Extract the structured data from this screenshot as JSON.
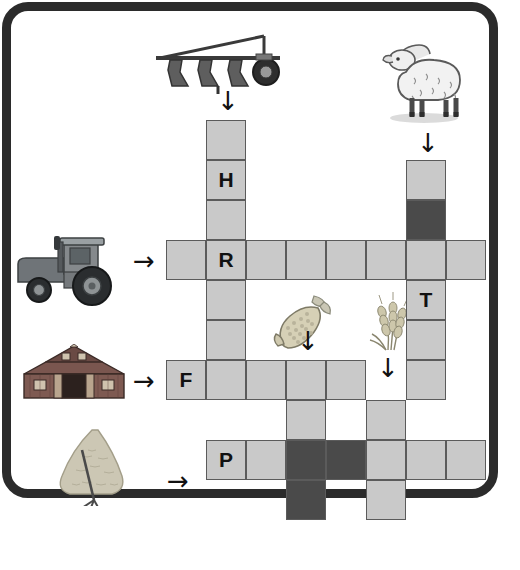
{
  "puzzle": {
    "title": "Farm crossword puzzle",
    "cell_size": 40,
    "colors": {
      "cell_light": "#c9c9c9",
      "cell_dark": "#4a4a4a",
      "cell_border": "#5b5b5b",
      "frame": "#2b2b2b",
      "page": "#ffffff"
    },
    "cells": [
      {
        "name": "cell-r0c1",
        "x": 206,
        "y": 120,
        "fill": "light",
        "letter": ""
      },
      {
        "name": "cell-r1c1",
        "x": 206,
        "y": 160,
        "fill": "light",
        "letter": "H"
      },
      {
        "name": "cell-r2c1",
        "x": 206,
        "y": 200,
        "fill": "light",
        "letter": ""
      },
      {
        "name": "cell-r0c6",
        "x": 406,
        "y": 160,
        "fill": "light",
        "letter": ""
      },
      {
        "name": "cell-r1c6",
        "x": 406,
        "y": 200,
        "fill": "dark",
        "letter": ""
      },
      {
        "name": "cell-r3c0",
        "x": 166,
        "y": 240,
        "fill": "light",
        "letter": ""
      },
      {
        "name": "cell-r3c1",
        "x": 206,
        "y": 240,
        "fill": "light",
        "letter": "R"
      },
      {
        "name": "cell-r3c2",
        "x": 246,
        "y": 240,
        "fill": "light",
        "letter": ""
      },
      {
        "name": "cell-r3c3",
        "x": 286,
        "y": 240,
        "fill": "light",
        "letter": ""
      },
      {
        "name": "cell-r3c4",
        "x": 326,
        "y": 240,
        "fill": "light",
        "letter": ""
      },
      {
        "name": "cell-r3c5",
        "x": 366,
        "y": 240,
        "fill": "light",
        "letter": ""
      },
      {
        "name": "cell-r3c6",
        "x": 406,
        "y": 240,
        "fill": "light",
        "letter": ""
      },
      {
        "name": "cell-r3c7",
        "x": 446,
        "y": 240,
        "fill": "light",
        "letter": ""
      },
      {
        "name": "cell-r4c1",
        "x": 206,
        "y": 280,
        "fill": "light",
        "letter": ""
      },
      {
        "name": "cell-r4c6",
        "x": 406,
        "y": 280,
        "fill": "light",
        "letter": "T"
      },
      {
        "name": "cell-r5c1",
        "x": 206,
        "y": 320,
        "fill": "light",
        "letter": ""
      },
      {
        "name": "cell-r5c6",
        "x": 406,
        "y": 320,
        "fill": "light",
        "letter": ""
      },
      {
        "name": "cell-r6c0",
        "x": 166,
        "y": 360,
        "fill": "light",
        "letter": "F"
      },
      {
        "name": "cell-r6c1",
        "x": 206,
        "y": 360,
        "fill": "light",
        "letter": ""
      },
      {
        "name": "cell-r6c2",
        "x": 246,
        "y": 360,
        "fill": "light",
        "letter": ""
      },
      {
        "name": "cell-r6c3",
        "x": 286,
        "y": 360,
        "fill": "light",
        "letter": ""
      },
      {
        "name": "cell-r6c4",
        "x": 326,
        "y": 360,
        "fill": "light",
        "letter": ""
      },
      {
        "name": "cell-r6c6",
        "x": 406,
        "y": 360,
        "fill": "light",
        "letter": ""
      },
      {
        "name": "cell-r7c3",
        "x": 286,
        "y": 400,
        "fill": "light",
        "letter": ""
      },
      {
        "name": "cell-r7c5",
        "x": 366,
        "y": 400,
        "fill": "light",
        "letter": ""
      },
      {
        "name": "cell-r8c1",
        "x": 206,
        "y": 440,
        "fill": "light",
        "letter": "P"
      },
      {
        "name": "cell-r8c2",
        "x": 246,
        "y": 440,
        "fill": "light",
        "letter": ""
      },
      {
        "name": "cell-r8c3",
        "x": 286,
        "y": 440,
        "fill": "dark",
        "letter": ""
      },
      {
        "name": "cell-r8c4",
        "x": 326,
        "y": 440,
        "fill": "dark",
        "letter": ""
      },
      {
        "name": "cell-r8c5",
        "x": 366,
        "y": 440,
        "fill": "light",
        "letter": ""
      },
      {
        "name": "cell-r8c6",
        "x": 406,
        "y": 440,
        "fill": "light",
        "letter": ""
      },
      {
        "name": "cell-r8c7",
        "x": 446,
        "y": 440,
        "fill": "light",
        "letter": ""
      },
      {
        "name": "cell-r9c3",
        "x": 286,
        "y": 480,
        "fill": "dark",
        "letter": ""
      },
      {
        "name": "cell-r9c5",
        "x": 366,
        "y": 480,
        "fill": "light",
        "letter": ""
      }
    ],
    "letters_shown": [
      "H",
      "R",
      "T",
      "F",
      "P"
    ],
    "arrows": [
      {
        "name": "arrow-plow-down",
        "glyph": "down",
        "x": 217,
        "y": 88
      },
      {
        "name": "arrow-sheep-down",
        "glyph": "down",
        "x": 417,
        "y": 130
      },
      {
        "name": "arrow-tractor-right",
        "glyph": "right",
        "x": 133,
        "y": 248
      },
      {
        "name": "arrow-corn-down",
        "glyph": "down",
        "x": 297,
        "y": 328
      },
      {
        "name": "arrow-wheat-down",
        "glyph": "down",
        "x": 377,
        "y": 355
      },
      {
        "name": "arrow-barn-right",
        "glyph": "right",
        "x": 133,
        "y": 368
      },
      {
        "name": "arrow-hay-right",
        "glyph": "right",
        "x": 167,
        "y": 468
      }
    ],
    "pictures": [
      {
        "name": "plow-picture",
        "label": "plow",
        "x": 152,
        "y": 32,
        "w": 132,
        "h": 62
      },
      {
        "name": "sheep-picture",
        "label": "sheep",
        "x": 372,
        "y": 26,
        "w": 100,
        "h": 98
      },
      {
        "name": "tractor-picture",
        "label": "tractor",
        "x": 14,
        "y": 228,
        "w": 118,
        "h": 78
      },
      {
        "name": "corn-picture",
        "label": "corn",
        "x": 268,
        "y": 292,
        "w": 68,
        "h": 62
      },
      {
        "name": "wheat-picture",
        "label": "wheat",
        "x": 364,
        "y": 292,
        "w": 60,
        "h": 62
      },
      {
        "name": "barn-picture",
        "label": "barn",
        "x": 18,
        "y": 344,
        "w": 112,
        "h": 56
      },
      {
        "name": "haystack-picture",
        "label": "haystack",
        "x": 52,
        "y": 426,
        "w": 90,
        "h": 80
      }
    ]
  }
}
